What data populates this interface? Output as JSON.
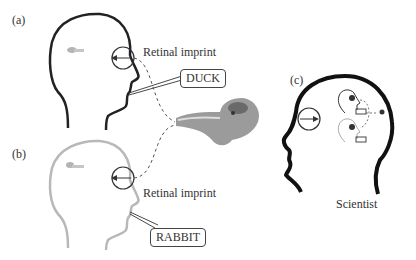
{
  "panels": {
    "a": {
      "label": "(a)",
      "retinal_label": "Retinal imprint",
      "speech": "DUCK",
      "head_color": "#222222"
    },
    "b": {
      "label": "(b)",
      "retinal_label": "Retinal imprint",
      "speech": "RABBIT",
      "head_color": "#b8b8b8"
    },
    "c": {
      "label": "(c)",
      "caption": "Scientist",
      "head_color": "#111111"
    }
  },
  "stimulus": {
    "name": "duck-rabbit ambiguous figure"
  }
}
